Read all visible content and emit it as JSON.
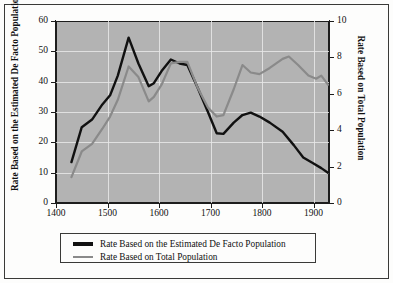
{
  "chart_data": {
    "type": "line",
    "title": "",
    "xlabel": "",
    "xlim": [
      1400,
      1930
    ],
    "xticks": [
      1400,
      1500,
      1600,
      1700,
      1800,
      1900
    ],
    "grid": true,
    "legend_position": "bottom",
    "axes": {
      "left": {
        "label": "Rate Based on the Estimated De Facto Population",
        "ylim": [
          0,
          60
        ],
        "yticks": [
          0,
          10,
          20,
          30,
          40,
          50,
          60
        ]
      },
      "right": {
        "label": "Rate Based on Total Population",
        "ylim": [
          0,
          10
        ],
        "yticks": [
          0,
          2,
          4,
          6,
          8,
          10
        ]
      }
    },
    "series": [
      {
        "name": "Rate Based on the Estimated De Facto Population",
        "color": "#111111",
        "axis": "left",
        "x": [
          1430,
          1450,
          1470,
          1490,
          1505,
          1520,
          1541,
          1560,
          1580,
          1590,
          1605,
          1623,
          1640,
          1655,
          1675,
          1695,
          1712,
          1725,
          1745,
          1762,
          1778,
          1795,
          1815,
          1840,
          1862,
          1880,
          1900,
          1915,
          1928
        ],
        "values": [
          13.5,
          25.0,
          27.5,
          32.5,
          35.5,
          42.0,
          54.5,
          46.0,
          38.5,
          39.5,
          43.5,
          47.3,
          46.0,
          45.5,
          38.0,
          30.0,
          23.0,
          22.8,
          26.5,
          29.0,
          29.8,
          28.5,
          26.5,
          23.5,
          19.0,
          15.0,
          13.0,
          11.5,
          10.0
        ]
      },
      {
        "name": "Rate Based on Total Population",
        "color": "#8a8a8a",
        "axis": "right",
        "x": [
          1430,
          1450,
          1470,
          1490,
          1505,
          1520,
          1541,
          1560,
          1580,
          1590,
          1605,
          1623,
          1640,
          1655,
          1675,
          1695,
          1712,
          1725,
          1745,
          1762,
          1778,
          1795,
          1815,
          1840,
          1852,
          1870,
          1890,
          1905,
          1915,
          1928
        ],
        "values": [
          1.42,
          2.83,
          3.25,
          4.08,
          4.75,
          5.67,
          7.5,
          6.92,
          5.58,
          5.83,
          6.5,
          7.67,
          7.75,
          7.75,
          6.33,
          5.25,
          4.75,
          4.83,
          6.25,
          7.58,
          7.17,
          7.08,
          7.42,
          7.92,
          8.05,
          7.58,
          7.0,
          6.83,
          7.0,
          6.5
        ]
      }
    ]
  },
  "legend": {
    "items": [
      {
        "label": "Rate Based on the Estimated De Facto Population",
        "color": "#111111"
      },
      {
        "label": "Rate Based on Total Population",
        "color": "#8a8a8a"
      }
    ]
  },
  "style": {
    "plot_background": "#b3b3b3",
    "figure_background": "#fdfdfc",
    "gridline_color": "#e8e8e8",
    "frame_color": "#3a3a38"
  }
}
